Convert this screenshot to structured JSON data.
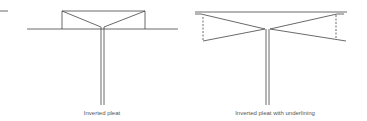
{
  "figures": [
    {
      "id": "inverted-pleat",
      "caption": "Inverted pleat",
      "caption_x": 102,
      "caption_y": 110
    },
    {
      "id": "inverted-pleat-underlining",
      "caption": "Inverted pleat with underlining",
      "caption_x": 275,
      "caption_y": 110
    }
  ],
  "colors": {
    "line": "#444444",
    "background": "#ffffff",
    "caption": "#555555"
  }
}
